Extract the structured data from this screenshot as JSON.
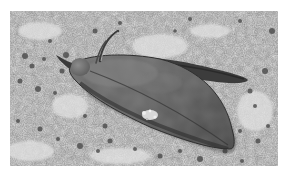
{
  "image": {
    "alt": "Grayscale photograph of a moth resting on a lichen-speckled stone surface",
    "subject": "moth",
    "background": "lichen-covered stone",
    "colors": {
      "page": "#ffffff",
      "stone_light": "#d2d2d2",
      "stone_mid": "#a8a8a8",
      "speckle_dark": "#4a4a4a",
      "moth_body": "#5e5e5e",
      "moth_shadow": "#3a3a3a",
      "moth_highlight": "#8a8a8a",
      "wing_spot": "#cfcfcf"
    }
  }
}
